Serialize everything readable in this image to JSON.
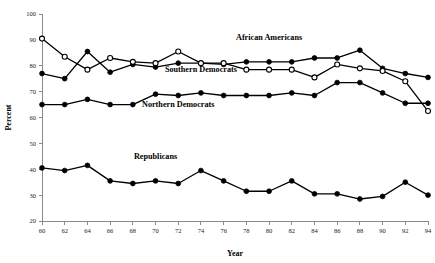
{
  "chart_data": {
    "type": "line",
    "title": "",
    "xlabel": "Year",
    "ylabel": "Percent",
    "xlim": [
      60,
      94
    ],
    "ylim": [
      20,
      100
    ],
    "x_ticks": [
      60,
      62,
      64,
      66,
      68,
      70,
      72,
      74,
      76,
      78,
      80,
      82,
      84,
      86,
      88,
      90,
      92,
      94
    ],
    "y_ticks": [
      20,
      30,
      40,
      50,
      60,
      70,
      80,
      90,
      100
    ],
    "grid": false,
    "legend_position": "inline-annotations",
    "x": [
      60,
      62,
      64,
      66,
      68,
      70,
      72,
      74,
      76,
      78,
      80,
      82,
      84,
      86,
      88,
      90,
      92,
      94
    ],
    "series": [
      {
        "name": "African Americans",
        "marker": "filled-circle",
        "values": [
          77,
          75,
          85.5,
          77.5,
          80.5,
          79.5,
          81,
          81,
          80.5,
          81.5,
          81.5,
          81.5,
          83,
          83,
          86,
          79,
          77,
          75.5
        ],
        "label_x": 80,
        "label_y": 90
      },
      {
        "name": "Southern Democrats",
        "marker": "open-circle",
        "values": [
          90.5,
          83.5,
          78.5,
          83,
          81.5,
          81,
          85.5,
          81,
          81,
          78.5,
          78.5,
          78.5,
          75.5,
          80.5,
          79,
          78,
          74,
          62.5
        ],
        "label_x": 74,
        "label_y": 77.5
      },
      {
        "name": "Northern Democrats",
        "marker": "filled-circle",
        "values": [
          65,
          65,
          67,
          65,
          65,
          69,
          68.5,
          69.5,
          68.5,
          68.5,
          68.5,
          69.5,
          68.5,
          73.5,
          73.5,
          69.5,
          65.5,
          65.5
        ],
        "label_x": 72,
        "label_y": 64
      },
      {
        "name": "Republicans",
        "marker": "filled-circle",
        "values": [
          40.5,
          39.5,
          41.5,
          35.5,
          34.5,
          35.5,
          34.5,
          39.5,
          35.5,
          31.5,
          31.5,
          35.5,
          30.5,
          30.5,
          28.5,
          29.5,
          35,
          30
        ],
        "label_x": 70,
        "label_y": 44
      }
    ]
  }
}
